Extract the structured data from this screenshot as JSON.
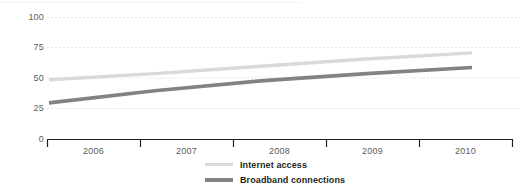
{
  "chart_data": {
    "type": "line",
    "title": "",
    "subtitle": "",
    "xlabel": "",
    "ylabel": "",
    "categories": [
      "2006",
      "2007",
      "2008",
      "2009",
      "2010"
    ],
    "ylim": [
      0,
      100
    ],
    "yticks": [
      0,
      25,
      50,
      75,
      100
    ],
    "ytick_labels": [
      "0",
      "25",
      "50",
      "75",
      "100"
    ],
    "grid": true,
    "grid_style": "dotted-horizontal",
    "legend_position": "bottom-center",
    "series": [
      {
        "name": "Internet access",
        "color": "#d9d9d9",
        "values": [
          49,
          54,
          60,
          66,
          71
        ]
      },
      {
        "name": "Broadband connections",
        "color": "#808285",
        "values": [
          30,
          40,
          48,
          54,
          59
        ]
      }
    ]
  },
  "axis": {
    "y_tick_color": "#5b5b5b",
    "x_tick_color": "#5b5b5b",
    "baseline_color": "#231f20",
    "grid_color": "#e8e8e8"
  },
  "legend": {
    "items": [
      {
        "label": "Internet access",
        "color": "#d9d9d9"
      },
      {
        "label": "Broadband connections",
        "color": "#808285"
      }
    ]
  }
}
